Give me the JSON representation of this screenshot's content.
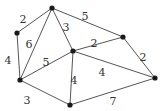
{
  "diagram": {
    "type": "weighted-undirected-graph",
    "nodes": [
      {
        "id": "A",
        "x": 52,
        "y": 8
      },
      {
        "id": "B",
        "x": 17,
        "y": 33
      },
      {
        "id": "C",
        "x": 73,
        "y": 51
      },
      {
        "id": "D",
        "x": 123,
        "y": 37
      },
      {
        "id": "E",
        "x": 20,
        "y": 80
      },
      {
        "id": "F",
        "x": 70,
        "y": 105
      },
      {
        "id": "G",
        "x": 155,
        "y": 78
      }
    ],
    "edges": [
      {
        "from": "A",
        "to": "B",
        "weight": "2",
        "lx": 23,
        "ly": 20
      },
      {
        "from": "A",
        "to": "E",
        "weight": "6",
        "lx": 29,
        "ly": 45
      },
      {
        "from": "A",
        "to": "C",
        "weight": "3",
        "lx": 66,
        "ly": 28
      },
      {
        "from": "A",
        "to": "D",
        "weight": "5",
        "lx": 85,
        "ly": 17
      },
      {
        "from": "B",
        "to": "E",
        "weight": "4",
        "lx": 8,
        "ly": 61
      },
      {
        "from": "E",
        "to": "C",
        "weight": "5",
        "lx": 46,
        "ly": 63
      },
      {
        "from": "C",
        "to": "D",
        "weight": "2",
        "lx": 94,
        "ly": 44
      },
      {
        "from": "C",
        "to": "F",
        "weight": "4",
        "lx": 74,
        "ly": 81
      },
      {
        "from": "C",
        "to": "G",
        "weight": "4",
        "lx": 102,
        "ly": 73
      },
      {
        "from": "D",
        "to": "G",
        "weight": "2",
        "lx": 143,
        "ly": 58
      },
      {
        "from": "E",
        "to": "F",
        "weight": "3",
        "lx": 27,
        "ly": 101
      },
      {
        "from": "F",
        "to": "G",
        "weight": "7",
        "lx": 113,
        "ly": 102
      }
    ]
  }
}
